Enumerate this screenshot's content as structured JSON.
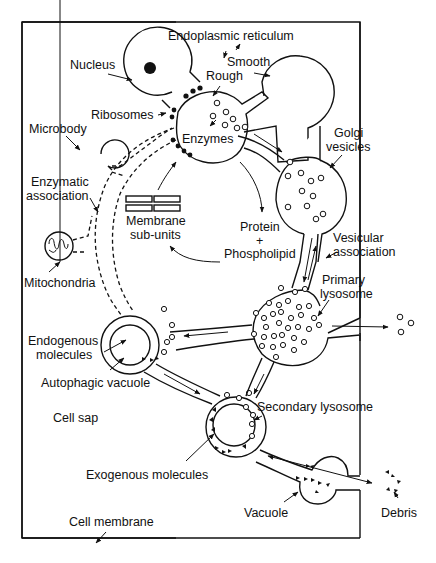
{
  "diagram": {
    "type": "cell-organelle-pathway",
    "frame": "cell-membrane-boundary",
    "labels": {
      "endoplasmic_reticulum": "Endoplasmic reticulum",
      "smooth": "Smooth",
      "rough": "Rough",
      "nucleus": "Nucleus",
      "ribosomes": "Ribosomes",
      "microbody": "Microbody",
      "enzymes": "Enzymes",
      "golgi_1": "Golgi",
      "golgi_2": "vesicles",
      "enzymatic_1": "Enzymatic",
      "enzymatic_2": "association",
      "membrane_1": "Membrane",
      "membrane_2": "sub-units",
      "protein_1": "Protein",
      "protein_plus": "+",
      "protein_2": "Phospholipid",
      "mitochondria": "Mitochondria",
      "vesicular_1": "Vesicular",
      "vesicular_2": "association",
      "primary_1": "Primary",
      "primary_2": "lysosome",
      "endogenous_1": "Endogenous",
      "endogenous_2": "molecules",
      "autophagic": "Autophagic vacuole",
      "cell_sap": "Cell sap",
      "secondary": "Secondary lysosome",
      "exogenous": "Exogenous molecules",
      "vacuole": "Vacuole",
      "debris": "Debris",
      "cell_membrane": "Cell membrane"
    },
    "nodes": [
      "Nucleus",
      "Rough endoplasmic reticulum",
      "Smooth endoplasmic reticulum",
      "Golgi vesicles",
      "Microbody",
      "Mitochondria",
      "Primary lysosome",
      "Autophagic vacuole",
      "Secondary lysosome",
      "Vacuole",
      "Membrane sub-units"
    ],
    "edges": [
      {
        "from": "Nucleus",
        "to": "Rough endoplasmic reticulum"
      },
      {
        "from": "Rough endoplasmic reticulum",
        "to": "Smooth endoplasmic reticulum"
      },
      {
        "from": "Rough endoplasmic reticulum",
        "to": "Golgi vesicles"
      },
      {
        "from": "Golgi vesicles",
        "to": "Primary lysosome",
        "label": "Vesicular association"
      },
      {
        "from": "Primary lysosome",
        "to": "Autophagic vacuole"
      },
      {
        "from": "Primary lysosome",
        "to": "Secondary lysosome"
      },
      {
        "from": "Autophagic vacuole",
        "to": "Secondary lysosome"
      },
      {
        "from": "Secondary lysosome",
        "to": "Vacuole"
      },
      {
        "from": "Vacuole",
        "to": "Debris"
      },
      {
        "from": "Rough endoplasmic reticulum",
        "to": "Protein + Phospholipid"
      },
      {
        "from": "Protein + Phospholipid",
        "to": "Membrane sub-units"
      },
      {
        "from": "Membrane sub-units",
        "to": "Rough endoplasmic reticulum"
      },
      {
        "from": "Microbody",
        "to": "Rough endoplasmic reticulum",
        "label": "Enzymatic association",
        "style": "dashed"
      },
      {
        "from": "Mitochondria",
        "to": "Autophagic vacuole",
        "label": "Enzymatic association",
        "style": "dashed"
      }
    ]
  }
}
